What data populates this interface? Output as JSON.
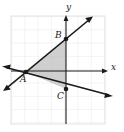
{
  "figure": {
    "title": "",
    "type": "coordinate-plane-diagram",
    "background": "#ffffff",
    "width": 124,
    "height": 132
  },
  "colors": {
    "grid": "#e8e8ea",
    "grid_border": "#e0e0e2",
    "axis": "#1a1a1a",
    "line": "#1a1a1a",
    "shade_fill": "#b8b8b8",
    "point": "#1a1a1a",
    "label": "#1a1a1a"
  },
  "grid": {
    "left": 11,
    "top": 16,
    "right": 105,
    "bottom": 124,
    "cell": 13.3,
    "visible": true
  },
  "axes": {
    "x": {
      "label": "x",
      "y_pixel": 71,
      "x_start": 11,
      "x_end": 108,
      "arrow": "right"
    },
    "y": {
      "label": "y",
      "x_pixel": 66,
      "y_start": 124,
      "y_end": 16,
      "arrow": "up"
    }
  },
  "points": [
    {
      "label": "A",
      "x": 26,
      "y": 72,
      "on_axis": "x-axis",
      "marker": "filled-dot"
    },
    {
      "label": "B",
      "x": 66,
      "y": 39,
      "on_axis": "y-axis",
      "marker": "filled-dot"
    },
    {
      "label": "C",
      "x": 66,
      "y": 89,
      "on_axis": "y-axis",
      "marker": "filled-dot"
    }
  ],
  "lines": [
    {
      "name": "rising-line",
      "description": "line through A and B with positive slope",
      "x1": 4,
      "y1": 90,
      "x2": 92,
      "y2": 17,
      "arrows": "both"
    },
    {
      "name": "falling-line",
      "description": "line through A and C with negative slope",
      "x1": 3,
      "y1": 68,
      "x2": 112,
      "y2": 97,
      "arrows": "both"
    }
  ],
  "shaded_region": {
    "name": "triangle-ABC",
    "vertices": [
      "A",
      "B",
      "C"
    ],
    "fill": "#b8b8b8",
    "opacity": 0.65
  },
  "labels": {
    "A": "A",
    "B": "B",
    "C": "C",
    "x": "x",
    "y": "y"
  }
}
